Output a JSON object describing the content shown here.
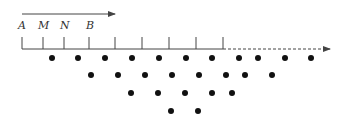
{
  "diagram": {
    "colors": {
      "line": "#444444",
      "dot": "#111111",
      "background": "#ffffff"
    },
    "top_arrow": {
      "x1": 22,
      "x2": 115,
      "y": 14
    },
    "labels": [
      {
        "text": "A",
        "x": 18,
        "y": 29
      },
      {
        "text": "M",
        "x": 38,
        "y": 29
      },
      {
        "text": "N",
        "x": 60,
        "y": 29
      },
      {
        "text": "B",
        "x": 86,
        "y": 29
      }
    ],
    "baseline": {
      "y": 49,
      "x_start": 22,
      "x_solid_end": 223,
      "x_dashed_end": 330
    },
    "ticks": [
      22,
      43,
      64,
      89,
      115,
      142,
      169,
      196,
      223
    ],
    "tick_top_y": 37,
    "dot_rows": [
      {
        "y": 58,
        "xs": [
          52,
          78,
          105,
          132,
          159,
          186,
          212,
          239,
          258,
          285,
          311
        ]
      },
      {
        "y": 75,
        "xs": [
          91,
          118,
          145,
          172,
          199,
          226,
          245,
          272
        ]
      },
      {
        "y": 93,
        "xs": [
          131,
          158,
          185,
          212,
          232
        ]
      },
      {
        "y": 111,
        "xs": [
          171,
          198
        ]
      }
    ]
  }
}
